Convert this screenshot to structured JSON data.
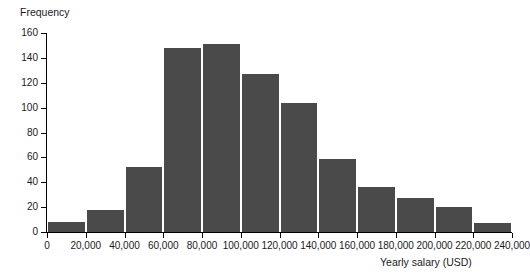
{
  "chart_data": {
    "type": "bar",
    "title": "",
    "subtitle": "",
    "xlabel": "Yearly salary (USD)",
    "ylabel": "Frequency",
    "grid": false,
    "legend": "none",
    "bar_color": "#4a4a4a",
    "axis_color": "#000000",
    "background_color": "#ffffff",
    "xlim": [
      0,
      240000
    ],
    "ylim": [
      0,
      160
    ],
    "bin_width": 20000,
    "x_ticks": [
      0,
      20000,
      40000,
      60000,
      80000,
      100000,
      120000,
      140000,
      160000,
      180000,
      200000,
      220000,
      240000
    ],
    "x_tick_labels": [
      "0",
      "20,000",
      "40,000",
      "60,000",
      "80,000",
      "100,000",
      "120,000",
      "140,000",
      "160,000",
      "180,000",
      "200,000",
      "220,000",
      "240,000"
    ],
    "y_ticks": [
      0,
      20,
      40,
      60,
      80,
      100,
      120,
      140,
      160
    ],
    "y_tick_labels": [
      "0",
      "20",
      "40",
      "60",
      "80",
      "100",
      "120",
      "140",
      "160"
    ],
    "categories": [
      "0-20,000",
      "20,000-40,000",
      "40,000-60,000",
      "60,000-80,000",
      "80,000-100,000",
      "100,000-120,000",
      "120,000-140,000",
      "140,000-160,000",
      "160,000-180,000",
      "180,000-200,000",
      "200,000-220,000",
      "220,000-240,000"
    ],
    "bin_edges": [
      0,
      20000,
      40000,
      60000,
      80000,
      100000,
      120000,
      140000,
      160000,
      180000,
      200000,
      220000,
      240000
    ],
    "values": [
      8,
      18,
      52,
      148,
      151,
      127,
      104,
      59,
      36,
      27,
      20,
      7
    ]
  }
}
